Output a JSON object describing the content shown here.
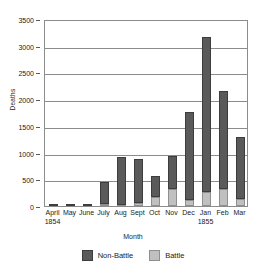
{
  "chart_data": {
    "type": "bar",
    "stacked": true,
    "title": "",
    "xlabel": "Month",
    "ylabel": "Deaths",
    "ylim": [
      0,
      3500
    ],
    "ytick_step": 500,
    "yticks": [
      0,
      500,
      1000,
      1500,
      2000,
      2500,
      3000,
      3500
    ],
    "grid": true,
    "legend_position": "bottom",
    "categories": [
      "April 1854",
      "May",
      "June",
      "July",
      "Aug",
      "Sept",
      "Oct",
      "Nov",
      "Dec",
      "Jan 1855",
      "Feb",
      "Mar"
    ],
    "category_labels": [
      {
        "month": "April",
        "year": "1854"
      },
      {
        "month": "May",
        "year": ""
      },
      {
        "month": "June",
        "year": ""
      },
      {
        "month": "July",
        "year": ""
      },
      {
        "month": "Aug",
        "year": ""
      },
      {
        "month": "Sept",
        "year": ""
      },
      {
        "month": "Oct",
        "year": ""
      },
      {
        "month": "Nov",
        "year": ""
      },
      {
        "month": "Dec",
        "year": ""
      },
      {
        "month": "Jan",
        "year": "1855"
      },
      {
        "month": "Feb",
        "year": ""
      },
      {
        "month": "Mar",
        "year": ""
      }
    ],
    "series": [
      {
        "name": "Battle",
        "color": "#c0c0c0",
        "values": [
          0,
          0,
          0,
          30,
          15,
          65,
          170,
          315,
          115,
          270,
          310,
          140
        ]
      },
      {
        "name": "Non-Battle",
        "color": "#5a5a5a",
        "values": [
          10,
          25,
          25,
          420,
          910,
          820,
          385,
          615,
          1650,
          2890,
          1850,
          1150
        ]
      }
    ],
    "totals": [
      10,
      25,
      25,
      450,
      925,
      885,
      555,
      930,
      1765,
      3160,
      2160,
      1290
    ]
  },
  "legend": {
    "items": [
      {
        "label": "Non-Battle",
        "color": "#5a5a5a"
      },
      {
        "label": "Battle",
        "color": "#c0c0c0"
      }
    ]
  },
  "axes": {
    "y_title": "Deaths",
    "x_title": "Month"
  }
}
